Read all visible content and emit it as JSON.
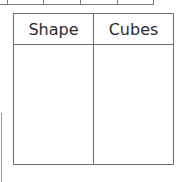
{
  "table": {
    "headers": [
      "Shape",
      "Cubes"
    ],
    "rows": [
      [
        "",
        ""
      ]
    ]
  },
  "colors": {
    "border": "#6f6f6f",
    "text": "#2b2b2b"
  }
}
